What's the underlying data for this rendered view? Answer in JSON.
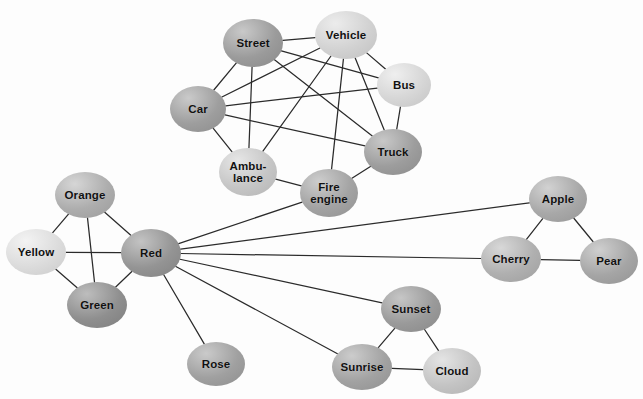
{
  "figure": {
    "kind": "network-graph",
    "background_color": "#fdfdfd",
    "edge_color": "#2b2b2b",
    "label_color": "#111111",
    "width": 643,
    "height": 399
  },
  "chart_data": {
    "type": "network",
    "title": "",
    "xlabel": "",
    "ylabel": "",
    "directed": false,
    "clusters": [
      {
        "name": "vehicles",
        "members": [
          "Street",
          "Vehicle",
          "Bus",
          "Car",
          "Truck",
          "Ambu-\nlance",
          "Fire\nengine"
        ]
      },
      {
        "name": "colors",
        "members": [
          "Orange",
          "Yellow",
          "Red",
          "Green"
        ]
      },
      {
        "name": "flowers",
        "members": [
          "Rose"
        ]
      },
      {
        "name": "fruits",
        "members": [
          "Apple",
          "Cherry",
          "Pear"
        ]
      },
      {
        "name": "sky",
        "members": [
          "Sunset",
          "Sunrise",
          "Cloud"
        ]
      }
    ],
    "nodes": [
      {
        "id": "street",
        "label": "Street",
        "x": 253,
        "y": 43,
        "rx": 30,
        "ry": 24,
        "fill": "#9b9b9b",
        "highlight": "#c9c9c9"
      },
      {
        "id": "vehicle",
        "label": "Vehicle",
        "x": 346,
        "y": 35,
        "rx": 31,
        "ry": 24,
        "fill": "#d2d2d2",
        "highlight": "#ececec"
      },
      {
        "id": "bus",
        "label": "Bus",
        "x": 404,
        "y": 85,
        "rx": 27,
        "ry": 22,
        "fill": "#d6d6d6",
        "highlight": "#efefef"
      },
      {
        "id": "car",
        "label": "Car",
        "x": 198,
        "y": 109,
        "rx": 28,
        "ry": 23,
        "fill": "#9e9e9e",
        "highlight": "#cacaca"
      },
      {
        "id": "truck",
        "label": "Truck",
        "x": 393,
        "y": 152,
        "rx": 29,
        "ry": 23,
        "fill": "#9d9d9d",
        "highlight": "#c8c8c8"
      },
      {
        "id": "ambulance",
        "label": "Ambu-\nlance",
        "x": 248,
        "y": 172,
        "rx": 29,
        "ry": 24,
        "fill": "#c6c6c6",
        "highlight": "#e6e6e6"
      },
      {
        "id": "fireengine",
        "label": "Fire\nengine",
        "x": 329,
        "y": 193,
        "rx": 29,
        "ry": 24,
        "fill": "#a3a3a3",
        "highlight": "#cdcdcd"
      },
      {
        "id": "orange",
        "label": "Orange",
        "x": 85,
        "y": 195,
        "rx": 30,
        "ry": 23,
        "fill": "#adadad",
        "highlight": "#d6d6d6"
      },
      {
        "id": "yellow",
        "label": "Yellow",
        "x": 36,
        "y": 252,
        "rx": 30,
        "ry": 23,
        "fill": "#dcdcdc",
        "highlight": "#f3f3f3"
      },
      {
        "id": "red",
        "label": "Red",
        "x": 151,
        "y": 253,
        "rx": 30,
        "ry": 24,
        "fill": "#949494",
        "highlight": "#c3c3c3"
      },
      {
        "id": "green",
        "label": "Green",
        "x": 97,
        "y": 305,
        "rx": 30,
        "ry": 23,
        "fill": "#8f8f8f",
        "highlight": "#bdbdbd"
      },
      {
        "id": "rose",
        "label": "Rose",
        "x": 216,
        "y": 364,
        "rx": 29,
        "ry": 22,
        "fill": "#a0a0a0",
        "highlight": "#cacaca"
      },
      {
        "id": "apple",
        "label": "Apple",
        "x": 558,
        "y": 199,
        "rx": 29,
        "ry": 23,
        "fill": "#a8a8a8",
        "highlight": "#d2d2d2"
      },
      {
        "id": "cherry",
        "label": "Cherry",
        "x": 511,
        "y": 259,
        "rx": 30,
        "ry": 23,
        "fill": "#b0b0b0",
        "highlight": "#d8d8d8"
      },
      {
        "id": "pear",
        "label": "Pear",
        "x": 609,
        "y": 261,
        "rx": 29,
        "ry": 23,
        "fill": "#a5a5a5",
        "highlight": "#cfcfcf"
      },
      {
        "id": "sunset",
        "label": "Sunset",
        "x": 411,
        "y": 309,
        "rx": 30,
        "ry": 23,
        "fill": "#9a9a9a",
        "highlight": "#c6c6c6"
      },
      {
        "id": "sunrise",
        "label": "Sunrise",
        "x": 362,
        "y": 367,
        "rx": 30,
        "ry": 23,
        "fill": "#a2a2a2",
        "highlight": "#cccccc"
      },
      {
        "id": "cloud",
        "label": "Cloud",
        "x": 452,
        "y": 371,
        "rx": 29,
        "ry": 23,
        "fill": "#c4c4c4",
        "highlight": "#e4e4e4"
      }
    ],
    "edges": [
      [
        "street",
        "vehicle"
      ],
      [
        "street",
        "car"
      ],
      [
        "street",
        "bus"
      ],
      [
        "street",
        "truck"
      ],
      [
        "street",
        "ambulance"
      ],
      [
        "vehicle",
        "bus"
      ],
      [
        "vehicle",
        "truck"
      ],
      [
        "vehicle",
        "car"
      ],
      [
        "vehicle",
        "ambulance"
      ],
      [
        "vehicle",
        "fireengine"
      ],
      [
        "bus",
        "truck"
      ],
      [
        "bus",
        "car"
      ],
      [
        "car",
        "truck"
      ],
      [
        "car",
        "ambulance"
      ],
      [
        "ambulance",
        "fireengine"
      ],
      [
        "fireengine",
        "truck"
      ],
      [
        "orange",
        "yellow"
      ],
      [
        "orange",
        "green"
      ],
      [
        "orange",
        "red"
      ],
      [
        "yellow",
        "red"
      ],
      [
        "yellow",
        "green"
      ],
      [
        "green",
        "red"
      ],
      [
        "red",
        "rose"
      ],
      [
        "red",
        "fireengine"
      ],
      [
        "red",
        "apple"
      ],
      [
        "red",
        "cherry"
      ],
      [
        "red",
        "sunset"
      ],
      [
        "red",
        "sunrise"
      ],
      [
        "apple",
        "cherry"
      ],
      [
        "apple",
        "pear"
      ],
      [
        "cherry",
        "pear"
      ],
      [
        "sunset",
        "sunrise"
      ],
      [
        "sunset",
        "cloud"
      ],
      [
        "sunrise",
        "cloud"
      ]
    ],
    "node_count": 18,
    "edge_count": 34,
    "hub_node": "red",
    "hub_degree": 9
  }
}
